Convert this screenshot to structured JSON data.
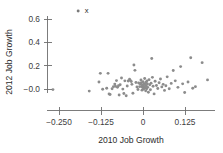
{
  "chart_data": {
    "type": "scatter",
    "title": "",
    "xlabel": "2010 Job Growth",
    "ylabel": "2012 Job Growth",
    "xlim": [
      -0.3,
      0.21
    ],
    "ylim": [
      -0.09,
      0.72
    ],
    "xticks": [
      -0.25,
      -0.125,
      0,
      0.125
    ],
    "xtick_labels": [
      "-0.250",
      "-0.125",
      "0",
      "0.125"
    ],
    "yticks": [
      0.6,
      0.4,
      0.2,
      -0.0
    ],
    "ytick_labels": [
      "0.6",
      "0.4",
      "0.2",
      "-0.0"
    ],
    "grid": false,
    "legend": null,
    "marker_color": "#8c8c8c",
    "axis_color": "#6e6e6e",
    "annotations": [
      {
        "text": "x",
        "x": -0.185,
        "y": 0.672
      }
    ],
    "points": [
      [
        -0.193,
        0.668
      ],
      [
        -0.268,
        -0.005
      ],
      [
        -0.16,
        -0.018
      ],
      [
        -0.131,
        0.06
      ],
      [
        -0.127,
        0.134
      ],
      [
        -0.12,
        -0.002
      ],
      [
        -0.108,
        0.006
      ],
      [
        -0.104,
        0.134
      ],
      [
        -0.101,
        -0.043
      ],
      [
        -0.098,
        -0.047
      ],
      [
        -0.092,
        0.002
      ],
      [
        -0.088,
        0.02
      ],
      [
        -0.084,
        0.042
      ],
      [
        -0.082,
        0.024
      ],
      [
        -0.079,
        0.072
      ],
      [
        -0.076,
        0.014
      ],
      [
        -0.073,
        0.028
      ],
      [
        -0.071,
        -0.052
      ],
      [
        -0.068,
        0.036
      ],
      [
        -0.064,
        0.094
      ],
      [
        -0.06,
        -0.001
      ],
      [
        -0.057,
        -0.038
      ],
      [
        -0.054,
        0.07
      ],
      [
        -0.05,
        -0.058
      ],
      [
        -0.047,
        0.026
      ],
      [
        -0.044,
        0.068
      ],
      [
        -0.04,
        0.084
      ],
      [
        -0.038,
        0.074
      ],
      [
        -0.035,
        0.064
      ],
      [
        -0.033,
        0.04
      ],
      [
        -0.03,
        -0.036
      ],
      [
        -0.027,
        0.206
      ],
      [
        -0.024,
        0.16
      ],
      [
        -0.021,
        0.056
      ],
      [
        -0.018,
        0.018
      ],
      [
        -0.015,
        -0.004
      ],
      [
        -0.013,
        0.052
      ],
      [
        -0.01,
        0.02
      ],
      [
        -0.008,
        0.042
      ],
      [
        -0.006,
        0.078
      ],
      [
        -0.005,
        0.054
      ],
      [
        -0.004,
        0.022
      ],
      [
        -0.003,
        -0.01
      ],
      [
        -0.002,
        0.034
      ],
      [
        -0.001,
        0.012
      ],
      [
        0.0,
        0.062
      ],
      [
        0.001,
        0.03
      ],
      [
        0.002,
        0.0
      ],
      [
        0.003,
        0.046
      ],
      [
        0.004,
        0.018
      ],
      [
        0.005,
        0.09
      ],
      [
        0.006,
        0.008
      ],
      [
        0.007,
        0.038
      ],
      [
        0.008,
        -0.016
      ],
      [
        0.009,
        0.058
      ],
      [
        0.01,
        0.026
      ],
      [
        0.011,
        0.002
      ],
      [
        0.012,
        0.07
      ],
      [
        0.013,
        0.044
      ],
      [
        0.014,
        0.014
      ],
      [
        0.016,
        -0.028
      ],
      [
        0.018,
        0.08
      ],
      [
        0.02,
        0.036
      ],
      [
        0.022,
        -0.006
      ],
      [
        0.024,
        0.05
      ],
      [
        0.026,
        0.262
      ],
      [
        0.028,
        0.1
      ],
      [
        0.03,
        0.024
      ],
      [
        0.033,
        -0.042
      ],
      [
        0.036,
        0.066
      ],
      [
        0.04,
        0.03
      ],
      [
        0.044,
        0.004
      ],
      [
        0.048,
        0.054
      ],
      [
        0.052,
        0.086
      ],
      [
        0.056,
        0.018
      ],
      [
        0.06,
        0.04
      ],
      [
        0.064,
        -0.012
      ],
      [
        0.068,
        0.028
      ],
      [
        0.072,
        0.104
      ],
      [
        0.078,
        0.002
      ],
      [
        0.084,
        0.048
      ],
      [
        0.09,
        0.158
      ],
      [
        0.096,
        0.07
      ],
      [
        0.104,
        0.014
      ],
      [
        0.112,
        0.192
      ],
      [
        0.118,
        0.044
      ],
      [
        0.124,
        -0.03
      ],
      [
        0.134,
        0.06
      ],
      [
        0.142,
        0.268
      ],
      [
        0.148,
        0.006
      ],
      [
        0.156,
        0.02
      ],
      [
        0.176,
        0.226
      ],
      [
        0.192,
        0.078
      ]
    ]
  },
  "axis": {
    "x_title": "2010 Job Growth",
    "y_title": "2012 Job Growth"
  }
}
